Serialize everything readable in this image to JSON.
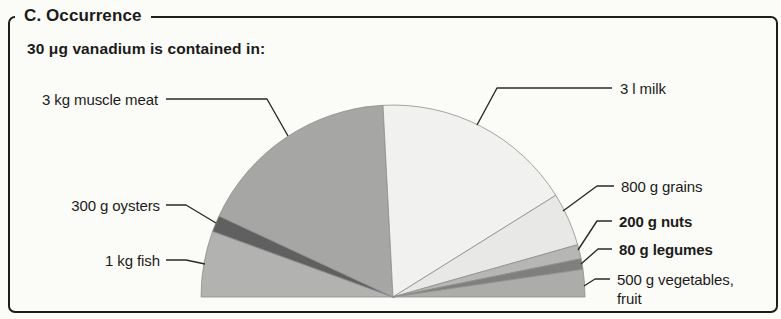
{
  "panel": {
    "title": "C. Occurrence",
    "subtitle": "30 μg vanadium is contained in:"
  },
  "chart_data": {
    "type": "pie",
    "shape": "semicircle",
    "title": "C. Occurrence",
    "subtitle": "30 μg vanadium is contained in:",
    "legend_position": "callout-labels",
    "segments": [
      {
        "id": "fish",
        "label": "1 kg fish",
        "quantity": "1 kg",
        "food": "fish",
        "start_angle": 180,
        "end_angle": 160,
        "angle_deg": 20,
        "color": "#b2b2b0",
        "bold_label": false
      },
      {
        "id": "oysters",
        "label": "300 g oysters",
        "quantity": "300 g",
        "food": "oysters",
        "start_angle": 160,
        "end_angle": 155,
        "angle_deg": 5,
        "color": "#606060",
        "bold_label": false
      },
      {
        "id": "muscle_meat",
        "label": "3 kg muscle meat",
        "quantity": "3 kg",
        "food": "muscle meat",
        "start_angle": 155,
        "end_angle": 93,
        "angle_deg": 62,
        "color": "#a6a6a4",
        "bold_label": false
      },
      {
        "id": "milk",
        "label": "3 l milk",
        "quantity": "3 l",
        "food": "milk",
        "start_angle": 93,
        "end_angle": 32,
        "angle_deg": 61,
        "color": "#f1f1ef",
        "bold_label": false
      },
      {
        "id": "grains",
        "label": "800 g grains",
        "quantity": "800 g",
        "food": "grains",
        "start_angle": 32,
        "end_angle": 15.8,
        "angle_deg": 16.2,
        "color": "#e8e8e6",
        "bold_label": false
      },
      {
        "id": "nuts",
        "label": "200 g nuts",
        "quantity": "200 g",
        "food": "nuts",
        "start_angle": 15.8,
        "end_angle": 11.5,
        "angle_deg": 4.3,
        "color": "#b6b6b4",
        "bold_label": true
      },
      {
        "id": "legumes",
        "label": "80 g legumes",
        "quantity": "80 g",
        "food": "legumes",
        "start_angle": 11.5,
        "end_angle": 8.3,
        "angle_deg": 3.2,
        "color": "#7f7f7d",
        "bold_label": true
      },
      {
        "id": "vegetables_fruit",
        "label": "500 g vegetables, fruit",
        "quantity": "500 g",
        "food": "vegetables, fruit",
        "start_angle": 8.3,
        "end_angle": 0,
        "angle_deg": 8.3,
        "color": "#acacaa",
        "bold_label": false
      }
    ]
  }
}
